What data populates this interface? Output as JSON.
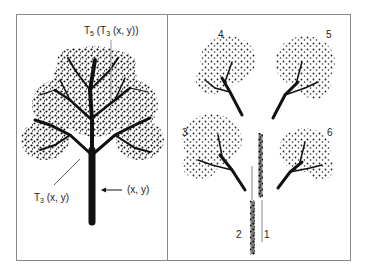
{
  "figure": {
    "left_panel": {
      "label_top": {
        "T": "T",
        "sub_outer": "5",
        "mid": " (T",
        "sub_inner": "3",
        "rest": " (x, y))"
      },
      "label_branch": {
        "T": "T",
        "sub": "3",
        "rest": " (x, y)"
      },
      "label_point": "(x, y)"
    },
    "right_panel": {
      "numbers": [
        "1",
        "2",
        "3",
        "4",
        "5",
        "6"
      ]
    }
  },
  "colors": {
    "ink": "#111111",
    "frame": "#8a8a8a",
    "leader": "#9a9a9a",
    "background": "#ffffff"
  }
}
